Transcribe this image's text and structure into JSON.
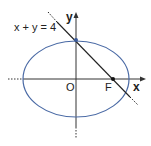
{
  "diagram": {
    "type": "ellipse-with-line",
    "line_equation": "x + y = 4",
    "axis_labels": {
      "x": "x",
      "y": "y"
    },
    "origin_label": "O",
    "focus_label": "F",
    "colors": {
      "ellipse": "#4a6aa5",
      "axes": "#333333",
      "line": "#222222",
      "point": "#111111",
      "top_point": "#3a5a9a"
    }
  }
}
